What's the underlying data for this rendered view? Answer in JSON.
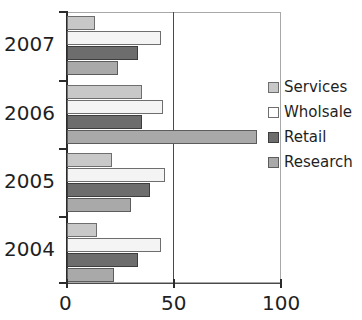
{
  "chart_data": {
    "type": "bar",
    "orientation": "horizontal",
    "title": "",
    "subtitle": "",
    "xlabel": "",
    "ylabel": "",
    "xlim": [
      0,
      100
    ],
    "xticks": [
      0,
      50,
      100
    ],
    "xtick_labels": [
      "0",
      "50",
      "100"
    ],
    "categories": [
      "2004",
      "2005",
      "2006",
      "2007"
    ],
    "category_order_top_to_bottom": [
      "2007",
      "2006",
      "2005",
      "2004"
    ],
    "grid": "vertical-at-50",
    "legend_position": "right",
    "series": [
      {
        "name": "Services",
        "color": "#c8c8c8",
        "values": [
          14,
          21,
          35,
          13
        ]
      },
      {
        "name": "Wholsale",
        "color": "#f4f4f4",
        "values": [
          44,
          46,
          45,
          44
        ]
      },
      {
        "name": "Retail",
        "color": "#6d6d6d",
        "values": [
          33,
          39,
          35,
          33
        ]
      },
      {
        "name": "Research",
        "color": "#a9a9a9",
        "values": [
          22,
          30,
          89,
          24
        ]
      }
    ],
    "groups_top_to_bottom": [
      {
        "category": "2007",
        "bars": [
          {
            "series": "Services",
            "value": 13
          },
          {
            "series": "Wholsale",
            "value": 44
          },
          {
            "series": "Retail",
            "value": 33
          },
          {
            "series": "Research",
            "value": 24
          }
        ]
      },
      {
        "category": "2006",
        "bars": [
          {
            "series": "Services",
            "value": 35
          },
          {
            "series": "Wholsale",
            "value": 45
          },
          {
            "series": "Retail",
            "value": 35
          },
          {
            "series": "Research",
            "value": 89
          }
        ]
      },
      {
        "category": "2005",
        "bars": [
          {
            "series": "Services",
            "value": 21
          },
          {
            "series": "Wholsale",
            "value": 46
          },
          {
            "series": "Retail",
            "value": 39
          },
          {
            "series": "Research",
            "value": 30
          }
        ]
      },
      {
        "category": "2004",
        "bars": [
          {
            "series": "Services",
            "value": 14
          },
          {
            "series": "Wholsale",
            "value": 44
          },
          {
            "series": "Retail",
            "value": 33
          },
          {
            "series": "Research",
            "value": 22
          }
        ]
      }
    ]
  },
  "axis": {
    "x_tick_labels": [
      "0",
      "50",
      "100"
    ],
    "y_category_labels": [
      "2007",
      "2006",
      "2005",
      "2004"
    ]
  },
  "legend": {
    "items": [
      {
        "label": "Services",
        "color": "#c8c8c8",
        "swatch": "filled-square-light-gray"
      },
      {
        "label": "Wholsale",
        "color": "#f4f4f4",
        "swatch": "hollow-square-white"
      },
      {
        "label": "Retail",
        "color": "#6d6d6d",
        "swatch": "filled-square-dark-gray"
      },
      {
        "label": "Research",
        "color": "#a9a9a9",
        "swatch": "filled-square-mid-gray"
      }
    ]
  }
}
